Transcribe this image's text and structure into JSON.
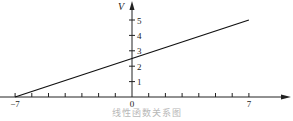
{
  "chart_data": {
    "type": "line",
    "title": "",
    "caption": "线性函数关系图",
    "xlabel": "",
    "ylabel": "V",
    "xlim": [
      -7,
      7
    ],
    "ylim": [
      0,
      5
    ],
    "x_tick_labels": [
      "-7",
      "0",
      "7"
    ],
    "x_minor_ticks": [
      -6,
      -5,
      -4,
      -3,
      -2,
      -1,
      1,
      2,
      3,
      4,
      5,
      6
    ],
    "y_tick_labels": [
      "1",
      "2",
      "3",
      "4",
      "5"
    ],
    "grid": false,
    "legend": null,
    "series": [
      {
        "name": "V",
        "x": [
          -7,
          0,
          7
        ],
        "y": [
          0,
          2.5,
          5
        ]
      }
    ]
  },
  "colors": {
    "axis": "#222222",
    "line": "#111111",
    "caption": "#b8b8b8"
  },
  "layout": {
    "origin_px": [
      132,
      97
    ],
    "x_unit_px": 16.7,
    "y_unit_px": 15.4
  }
}
